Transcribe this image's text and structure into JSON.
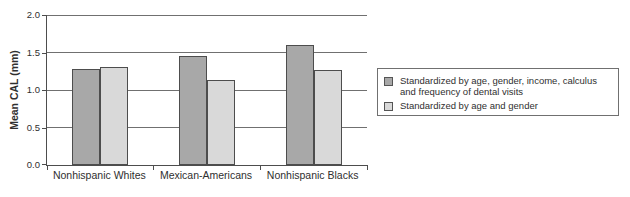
{
  "chart_data": {
    "type": "bar",
    "title": "",
    "xlabel": "",
    "ylabel": "Mean CAL (mm)",
    "categories": [
      "Nonhispanic Whites",
      "Mexican-Americans",
      "Nonhispanic Blacks"
    ],
    "series": [
      {
        "name": "Standardized by age, gender, income, calculus and frequency of dental visits",
        "color": "#a8a8a8",
        "values": [
          1.28,
          1.45,
          1.6
        ]
      },
      {
        "name": "Standardized by age and gender",
        "color": "#d9d9d9",
        "values": [
          1.31,
          1.14,
          1.27
        ]
      }
    ],
    "ylim": [
      0,
      2.0
    ],
    "yticks": [
      0.0,
      0.5,
      1.0,
      1.5,
      2.0
    ],
    "ytick_labels": [
      "0.0",
      "0.5",
      "1.0",
      "1.5",
      "2.0"
    ],
    "grid": true,
    "legend_position": "right"
  },
  "colors": {
    "grid": "#707070",
    "axis": "#4d4d4d",
    "bar_border": "#4d4d4d",
    "legend_border": "#707070",
    "text": "#2f2f2f",
    "background": "#ffffff"
  }
}
